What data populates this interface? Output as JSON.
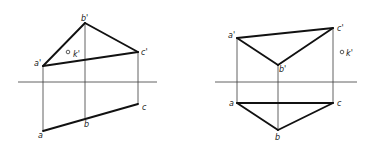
{
  "colors": {
    "background": "#ffffff",
    "thick_line": "#111111",
    "thin_line": "#3a3a3a",
    "label": "#222222"
  },
  "figures": [
    {
      "id": "left",
      "axis": {
        "x1": 18,
        "x2": 157,
        "y": 82
      },
      "front_view": {
        "a_prime": {
          "label": "a'",
          "x": 43,
          "y": 66
        },
        "b_prime": {
          "label": "b'",
          "x": 85,
          "y": 23
        },
        "c_prime": {
          "label": "c'",
          "x": 138,
          "y": 52
        },
        "k_prime": {
          "label": "k'",
          "x": 68,
          "y": 52
        }
      },
      "top_view": {
        "a": {
          "label": "a",
          "x": 43,
          "y": 131
        },
        "b": {
          "label": "b",
          "x": 85,
          "y": 118
        },
        "c": {
          "label": "c",
          "x": 138,
          "y": 104
        }
      }
    },
    {
      "id": "right",
      "axis": {
        "x1": 215,
        "x2": 357,
        "y": 82
      },
      "front_view": {
        "a_prime": {
          "label": "a'",
          "x": 237,
          "y": 38
        },
        "b_prime": {
          "label": "b'",
          "x": 278,
          "y": 65
        },
        "c_prime": {
          "label": "c'",
          "x": 333,
          "y": 28
        },
        "k_prime": {
          "label": "k'",
          "x": 342,
          "y": 52
        }
      },
      "top_view": {
        "a": {
          "label": "a",
          "x": 237,
          "y": 103
        },
        "b": {
          "label": "b",
          "x": 278,
          "y": 130
        },
        "c": {
          "label": "c",
          "x": 333,
          "y": 103
        }
      }
    }
  ]
}
